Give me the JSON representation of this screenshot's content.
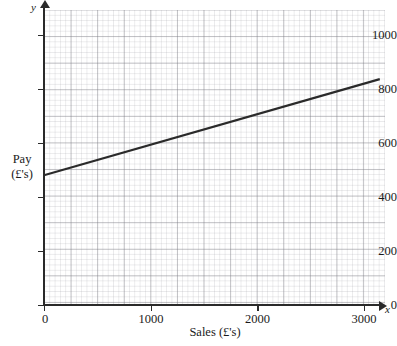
{
  "chart_data": {
    "type": "line",
    "title": "",
    "subtitle": "",
    "xlabel": "Sales (£'s)",
    "ylabel": "Pay (£'s)",
    "y_axis_name": "y",
    "x_axis_name": "x",
    "xlim": [
      0,
      3150
    ],
    "ylim": [
      0,
      1100
    ],
    "x_ticks": [
      0,
      1000,
      2000,
      3000
    ],
    "x_tick_labels": [
      "0",
      "1000",
      "2000",
      "3000"
    ],
    "y_ticks": [
      0,
      200,
      400,
      600,
      800,
      1000
    ],
    "y_tick_labels": [
      "0",
      "200",
      "400",
      "600",
      "800",
      "1000"
    ],
    "grid": true,
    "grid_major_x": 250,
    "grid_major_y": 100,
    "grid_minor_x": 50,
    "grid_minor_y": 20,
    "legend": false,
    "legend_position": "none",
    "line_color": "#2a2a2a",
    "series": [
      {
        "name": "Pay vs Sales",
        "x": [
          0,
          3150
        ],
        "values": [
          480,
          835
        ],
        "intercept": 480,
        "slope": 0.1127
      }
    ],
    "annotations": []
  },
  "axis_titles": {
    "y_line1": "Pay",
    "y_line2": "(£'s)",
    "x": "Sales (£'s)"
  },
  "colors": {
    "line": "#2a2a2a",
    "axis": "#2a2a2a",
    "grid_major": "#78788060",
    "grid_minor": "#96969e33",
    "background": "#ffffff",
    "text": "#1a1a1a"
  }
}
